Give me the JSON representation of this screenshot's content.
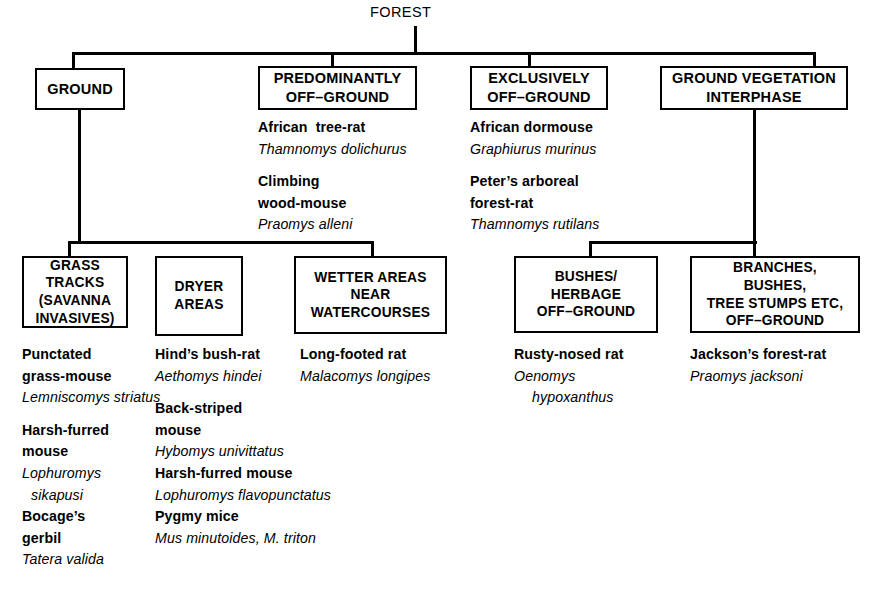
{
  "diagram": {
    "type": "hierarchy-tree",
    "root": {
      "label": "FOREST"
    },
    "level1": [
      {
        "id": "ground",
        "label": "GROUND"
      },
      {
        "id": "predominantly-off-ground",
        "label": "PREDOMINANTLY\nOFF–GROUND"
      },
      {
        "id": "exclusively-off-ground",
        "label": "EXCLUSIVELY\nOFF–GROUND"
      },
      {
        "id": "ground-vegetation-interphase",
        "label": "GROUND VEGETATION\nINTERPHASE"
      }
    ],
    "level2": [
      {
        "id": "grass-tracks",
        "label": "GRASS\nTRACKS\n(SAVANNA\nINVASIVES)"
      },
      {
        "id": "dryer-areas",
        "label": "DRYER\nAREAS"
      },
      {
        "id": "wetter-areas",
        "label": "WETTER AREAS\nNEAR\nWATERCOURSES"
      },
      {
        "id": "bushes-herbage",
        "label": "BUSHES/\nHERBAGE\nOFF–GROUND"
      },
      {
        "id": "branches-bushes",
        "label": "BRANCHES,\nBUSHES,\nTREE STUMPS ETC,\nOFF–GROUND"
      }
    ],
    "species_lists": {
      "predominantly_off_ground": [
        {
          "common": "African  tree-rat",
          "scientific": "Thamnomys dolichurus"
        },
        {
          "common": "Climbing\nwood-mouse",
          "scientific": "Praomys alleni"
        }
      ],
      "exclusively_off_ground": [
        {
          "common": "African dormouse",
          "scientific": "Graphiurus murinus"
        },
        {
          "common": "Peter’s arboreal\nforest-rat",
          "scientific": "Thamnomys rutilans"
        }
      ],
      "grass_tracks": [
        {
          "common": "Punctated\ngrass-mouse",
          "scientific": "Lemniscomys striatus"
        },
        {
          "common": "Harsh-furred\nmouse",
          "scientific": "Lophuromys\n sikapusi"
        },
        {
          "common": "Bocage’s\ngerbil",
          "scientific": "Tatera valida"
        }
      ],
      "dryer_areas": [
        {
          "common": "Hind’s bush-rat",
          "scientific": "Aethomys hindei"
        },
        {
          "common": "Back-striped\nmouse",
          "scientific": "Hybomys univittatus"
        },
        {
          "common": "Harsh-furred mouse",
          "scientific": "Lophuromys flavopunctatus"
        },
        {
          "common": "Pygmy mice",
          "scientific": "Mus minutoides, M. triton"
        }
      ],
      "wetter_areas": [
        {
          "common": "Long-footed rat",
          "scientific": "Malacomys longipes"
        }
      ],
      "bushes_herbage": [
        {
          "common": "Rusty-nosed rat",
          "scientific": "Oenomys\n  hypoxanthus"
        }
      ],
      "branches_bushes": [
        {
          "common": "Jackson’s forest-rat",
          "scientific": "Praomys jacksoni"
        }
      ]
    },
    "text_lines": {
      "col_predominantly": [
        {
          "style": "com",
          "text": "African  tree-rat"
        },
        {
          "style": "sci",
          "text": "Thamnomys dolichurus"
        },
        {
          "style": "gap",
          "text": ""
        },
        {
          "style": "com",
          "text": "Climbing"
        },
        {
          "style": "com",
          "text": "wood-mouse"
        },
        {
          "style": "sci",
          "text": "Praomys alleni"
        }
      ],
      "col_exclusively": [
        {
          "style": "com",
          "text": "African dormouse"
        },
        {
          "style": "sci",
          "text": "Graphiurus murinus"
        },
        {
          "style": "gap",
          "text": ""
        },
        {
          "style": "com",
          "text": "Peter’s arboreal"
        },
        {
          "style": "com",
          "text": "forest-rat"
        },
        {
          "style": "sci",
          "text": "Thamnomys rutilans"
        }
      ],
      "col_grass_tracks": [
        {
          "style": "com",
          "text": "Punctated"
        },
        {
          "style": "com",
          "text": "grass-mouse"
        },
        {
          "style": "sci",
          "text": "Lemniscomys striatus"
        },
        {
          "style": "gap",
          "text": ""
        },
        {
          "style": "com",
          "text": "Harsh-furred"
        },
        {
          "style": "com",
          "text": "mouse"
        },
        {
          "style": "sci",
          "text": "Lophuromys"
        },
        {
          "style": "sci-ind",
          "text": "sikapusi"
        },
        {
          "style": "com",
          "text": "Bocage’s"
        },
        {
          "style": "com",
          "text": "gerbil"
        },
        {
          "style": "sci",
          "text": "Tatera valida"
        }
      ],
      "col_dryer_areas": [
        {
          "style": "com",
          "text": "Hind’s bush-rat"
        },
        {
          "style": "sci",
          "text": "Aethomys hindei"
        },
        {
          "style": "gap",
          "text": ""
        },
        {
          "style": "com",
          "text": "Back-striped"
        },
        {
          "style": "com",
          "text": "mouse"
        },
        {
          "style": "sci",
          "text": "Hybomys univittatus"
        },
        {
          "style": "com",
          "text": "Harsh-furred mouse"
        },
        {
          "style": "sci",
          "text": "Lophuromys flavopunctatus"
        },
        {
          "style": "com",
          "text": "Pygmy mice"
        },
        {
          "style": "sci",
          "text": "Mus minutoides, M. triton"
        }
      ],
      "col_wetter_areas": [
        {
          "style": "com",
          "text": "Long-footed rat"
        },
        {
          "style": "sci",
          "text": "Malacomys longipes"
        }
      ],
      "col_bushes_herbage": [
        {
          "style": "com",
          "text": "Rusty-nosed rat"
        },
        {
          "style": "sci",
          "text": "Oenomys"
        },
        {
          "style": "sci-ind2",
          "text": "hypoxanthus"
        }
      ],
      "col_branches_bushes": [
        {
          "style": "com",
          "text": "Jackson’s forest-rat"
        },
        {
          "style": "sci",
          "text": "Praomys jacksoni"
        }
      ]
    },
    "colors": {
      "ink": "#000000",
      "paper": "#ffffff"
    }
  }
}
